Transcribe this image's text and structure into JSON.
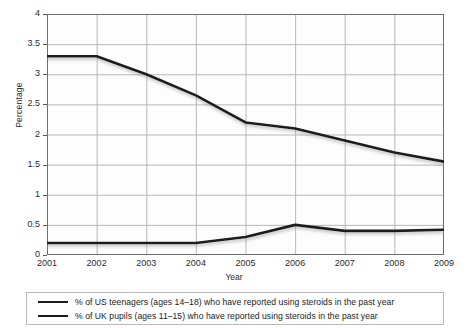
{
  "chart_data": {
    "type": "line",
    "title": "",
    "xlabel": "Year",
    "ylabel": "Percentage",
    "categories": [
      "2001",
      "2002",
      "2003",
      "2004",
      "2005",
      "2006",
      "2007",
      "2008",
      "2009"
    ],
    "ylim": [
      0,
      4
    ],
    "ytick_labels": [
      "0",
      "0.5",
      "1",
      "1.5",
      "2",
      "2.5",
      "3",
      "3.5",
      "4"
    ],
    "ytick_values": [
      0,
      0.5,
      1,
      1.5,
      2,
      2.5,
      3,
      3.5,
      4
    ],
    "grid": true,
    "legend_position": "below",
    "series": [
      {
        "name": "% of US teenagers (ages 14–18) who have reported using steroids in the past year",
        "color": "#1c1c1c",
        "values": [
          3.3,
          3.3,
          3.0,
          2.65,
          2.2,
          2.1,
          1.9,
          1.7,
          1.55
        ]
      },
      {
        "name": "% of UK pupils (ages 11–15) who have reported using steroids in the past year",
        "color": "#1c1c1c",
        "values": [
          0.2,
          0.2,
          0.2,
          0.2,
          0.3,
          0.5,
          0.4,
          0.4,
          0.42
        ]
      }
    ]
  },
  "legend": {
    "items": [
      {
        "label": "% of US teenagers (ages 14–18) who have reported using steroids in the past year"
      },
      {
        "label": "% of UK pupils (ages 11–15) who have reported using steroids in the past year"
      }
    ]
  },
  "colors": {
    "line": "#1c1c1c",
    "grid": "#b0b0b0",
    "axis": "#5a5a5a",
    "plot_background": "#fdfdfd",
    "legend_border": "#b9b9b9"
  }
}
